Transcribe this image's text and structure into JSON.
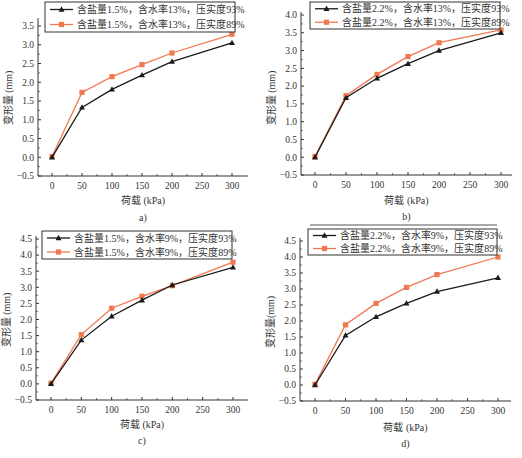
{
  "colors": {
    "series_93": "#1a1a1a",
    "series_89": "#f07850",
    "axis": "#333333",
    "legend_border": "#333333"
  },
  "chart_data": [
    {
      "id": "a",
      "type": "line",
      "caption": "a)",
      "xlabel": "荷载 (kPa)",
      "ylabel": "变形量 (mm)",
      "x": [
        0,
        50,
        100,
        150,
        200,
        300
      ],
      "xticks": [
        0,
        50,
        100,
        150,
        200,
        250,
        300
      ],
      "yticks": [
        -0.5,
        0.0,
        0.5,
        1.0,
        1.5,
        2.0,
        2.5,
        3.0,
        3.5
      ],
      "ylim": [
        -0.5,
        3.7
      ],
      "xlim": [
        -25,
        325
      ],
      "grid": false,
      "legend_position": "top",
      "series": [
        {
          "name": "含盐量1.5%，含水率13%，压实度93%",
          "marker": "triangle",
          "color_key": "series_93",
          "values": [
            0.0,
            1.33,
            1.81,
            2.19,
            2.55,
            3.05
          ]
        },
        {
          "name": "含盐量1.5%，含水率13%，压实度89%",
          "marker": "square",
          "color_key": "series_89",
          "values": [
            0.02,
            1.73,
            2.15,
            2.47,
            2.78,
            3.28
          ]
        }
      ]
    },
    {
      "id": "b",
      "type": "line",
      "caption": "b)",
      "xlabel": "荷载 (kPa)",
      "ylabel": "变形量 (mm)",
      "x": [
        0,
        50,
        100,
        150,
        200,
        300
      ],
      "xticks": [
        0,
        50,
        100,
        150,
        200,
        250,
        300
      ],
      "yticks": [
        -0.5,
        0.0,
        0.5,
        1.0,
        1.5,
        2.0,
        2.5,
        3.0,
        3.5,
        4.0
      ],
      "ylim": [
        -0.5,
        4.0
      ],
      "xlim": [
        -25,
        325
      ],
      "grid": false,
      "legend_position": "top",
      "series": [
        {
          "name": "含盐量2.2%，含水率13%，压实度93%",
          "marker": "triangle",
          "color_key": "series_93",
          "values": [
            0.0,
            1.67,
            2.22,
            2.63,
            3.0,
            3.5
          ]
        },
        {
          "name": "含盐量2.2%，含水率13%，压实度89%",
          "marker": "square",
          "color_key": "series_89",
          "values": [
            0.02,
            1.73,
            2.33,
            2.83,
            3.22,
            3.58
          ]
        }
      ]
    },
    {
      "id": "c",
      "type": "line",
      "caption": "c)",
      "xlabel": "荷载 (kPa)",
      "ylabel": "变形量 (mm)",
      "x": [
        0,
        50,
        100,
        150,
        200,
        300
      ],
      "xticks": [
        0,
        50,
        100,
        150,
        200,
        250,
        300
      ],
      "yticks": [
        -0.5,
        0.0,
        0.5,
        1.0,
        1.5,
        2.0,
        2.5,
        3.0,
        3.5,
        4.0,
        4.5
      ],
      "ylim": [
        -0.5,
        4.5
      ],
      "xlim": [
        -25,
        325
      ],
      "grid": false,
      "legend_position": "top",
      "series": [
        {
          "name": "含盐量1.5%，含水率9%，压实度93%",
          "marker": "triangle",
          "color_key": "series_93",
          "values": [
            0.0,
            1.36,
            2.1,
            2.6,
            3.07,
            3.62
          ]
        },
        {
          "name": "含盐量1.5%，含水率9%，压实度89%",
          "marker": "square",
          "color_key": "series_89",
          "values": [
            0.02,
            1.53,
            2.35,
            2.72,
            3.05,
            3.78
          ]
        }
      ]
    },
    {
      "id": "d",
      "type": "line",
      "caption": "d)",
      "xlabel": "荷载 (kPa)",
      "ylabel": "变形量(mm)",
      "x": [
        0,
        50,
        100,
        150,
        200,
        300
      ],
      "xticks": [
        0,
        50,
        100,
        150,
        200,
        250,
        300
      ],
      "yticks": [
        -0.5,
        0.0,
        0.5,
        1.0,
        1.5,
        2.0,
        2.5,
        3.0,
        3.5,
        4.0,
        4.5
      ],
      "ylim": [
        -0.5,
        4.5
      ],
      "xlim": [
        -25,
        325
      ],
      "grid": false,
      "legend_position": "top",
      "series": [
        {
          "name": "含盐量2.2%，含水率9%，压实度93%",
          "marker": "triangle",
          "color_key": "series_93",
          "values": [
            0.0,
            1.55,
            2.13,
            2.55,
            2.92,
            3.35
          ]
        },
        {
          "name": "含盐量2.2%，含水率9%，压实度89%",
          "marker": "square",
          "color_key": "series_89",
          "values": [
            0.02,
            1.88,
            2.55,
            3.05,
            3.45,
            4.0
          ]
        }
      ]
    }
  ]
}
